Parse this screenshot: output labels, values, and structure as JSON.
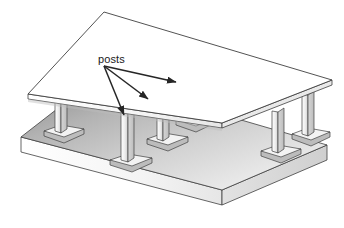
{
  "figure": {
    "type": "isometric-technical-illustration",
    "background_color": "#ffffff"
  },
  "annotations": {
    "label": "posts",
    "label_position": {
      "x": 98,
      "y": 63
    },
    "leader_origin": {
      "x": 104,
      "y": 66
    },
    "arrows": [
      {
        "name": "arrow-to-left-post",
        "to_x": 124,
        "to_y": 118,
        "head": "solid"
      },
      {
        "name": "arrow-to-center-post",
        "to_x": 150,
        "to_y": 101,
        "head": "solid"
      },
      {
        "name": "arrow-to-right-post",
        "to_x": 178,
        "to_y": 83,
        "head": "solid"
      }
    ]
  },
  "colors": {
    "outline": "#3a3a3a",
    "top_slab_top": "#ffffff",
    "top_slab_edge": "#e8e8e8",
    "top_slab_under_light": "#f2f2f2",
    "top_slab_under_dark": "#d4d4d4",
    "base_slab_top_dark": "#9a9a9a",
    "base_slab_top_light": "#e4e4e4",
    "base_slab_front_edge": "#f5f5f5",
    "base_slab_side_edge": "#d8d8d8",
    "post_light": "#fbfbfb",
    "post_shade": "#cfcfcf",
    "footing_top": "#f6f6f6",
    "footing_side": "#c8c8c8",
    "label_text": "#1a1a1a"
  },
  "geometry": {
    "top_slab": {
      "name": "upper-floor-slab",
      "top_face": "104,12 332,80 222,123 28,94",
      "front_left_edge": "28,94 28,99 222,128 222,123",
      "front_right_edge": "222,123 222,128 332,85 332,80",
      "thickness_px": 5
    },
    "base_slab": {
      "name": "lower-base-slab",
      "top_face": "97,78 327,145 222,190 21,137",
      "front_left_edge": "21,137 21,152 222,205 222,190",
      "front_right_edge": "222,190 222,205 327,160 327,145",
      "thickness_px": 15
    },
    "posts": [
      {
        "name": "post-left-front",
        "base_x": 63,
        "base_y": 128,
        "top_y": 97,
        "width": 7,
        "height": 31,
        "footing_w": 24,
        "footing_h": 9
      },
      {
        "name": "post-center-left",
        "base_x": 125,
        "base_y": 157,
        "top_y": 107,
        "width": 8,
        "height": 50,
        "footing_w": 28,
        "footing_h": 10
      },
      {
        "name": "post-center-mid",
        "base_x": 160,
        "base_y": 136,
        "top_y": 96,
        "width": 7,
        "height": 40,
        "footing_w": 25,
        "footing_h": 9
      },
      {
        "name": "post-center-back",
        "base_x": 188,
        "base_y": 118,
        "top_y": 84,
        "width": 7,
        "height": 34,
        "footing_w": 24,
        "footing_h": 9
      },
      {
        "name": "post-right-front",
        "base_x": 279,
        "base_y": 148,
        "top_y": 110,
        "width": 8,
        "height": 38,
        "footing_w": 27,
        "footing_h": 10
      },
      {
        "name": "post-right-back",
        "base_x": 309,
        "base_y": 131,
        "top_y": 94,
        "width": 8,
        "height": 37,
        "footing_w": 26,
        "footing_h": 10
      }
    ],
    "post_count": 6
  }
}
